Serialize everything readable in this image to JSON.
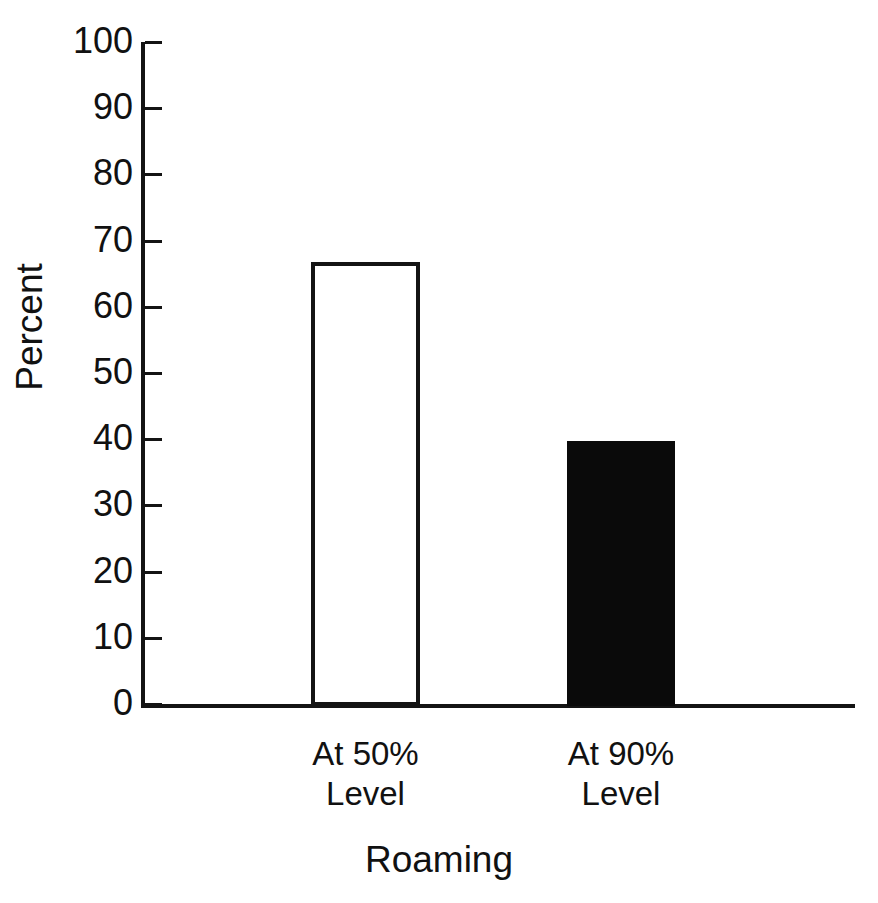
{
  "chart_data": {
    "type": "bar",
    "title": "",
    "subtitle": "",
    "xlabel": "Roaming",
    "ylabel": "Percent",
    "categories": [
      "At 50% Level",
      "At 90% Level"
    ],
    "category_lines": [
      {
        "line1": "At 50%",
        "line2": "Level"
      },
      {
        "line1": "At 90%",
        "line2": "Level"
      }
    ],
    "values": [
      66.7,
      39.8
    ],
    "ylim": [
      0,
      100
    ],
    "y_ticks": [
      0,
      10,
      20,
      30,
      40,
      50,
      60,
      70,
      80,
      90,
      100
    ],
    "y_tick_labels": [
      "0",
      "10",
      "20",
      "30",
      "40",
      "50",
      "60",
      "70",
      "80",
      "90",
      "100"
    ],
    "grid": false,
    "legend": "none",
    "bar_styles": [
      {
        "name": "At 50% Level",
        "fill": "#ffffff",
        "stroke": "#141414",
        "style": "outlined"
      },
      {
        "name": "At 90% Level",
        "fill": "#0a0a0a",
        "stroke": "#0a0a0a",
        "style": "solid"
      }
    ],
    "axis_color": "#141414",
    "background_color": "#ffffff",
    "tick_direction": "in"
  },
  "axes": {
    "y_title": "Percent",
    "x_title": "Roaming"
  }
}
